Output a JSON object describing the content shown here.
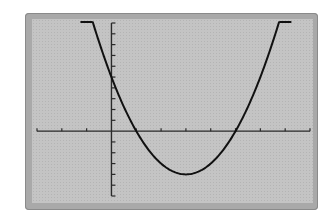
{
  "chart_data": {
    "type": "line",
    "title": "",
    "xlabel": "",
    "ylabel": "",
    "function": "y = x^2 - 6x + 5",
    "xlim": [
      -3,
      8
    ],
    "ylim": [
      -6,
      10
    ],
    "x_tick_step": 1,
    "y_tick_step": 1,
    "grid": false,
    "legend": null,
    "series": [
      {
        "name": "parabola",
        "x": [
          -1.2,
          -1,
          0,
          1,
          2,
          3,
          4,
          5,
          6,
          7,
          7.2
        ],
        "y": [
          13.64,
          12,
          5,
          0,
          -3,
          -4,
          -3,
          0,
          5,
          12,
          13.64
        ]
      }
    ],
    "key_points": {
      "x_intercepts": [
        1,
        5
      ],
      "y_intercept": 5,
      "vertex": [
        3,
        -4
      ]
    }
  },
  "colors": {
    "frame": "#a9a9a9",
    "screen": "#c4c4c4",
    "axis": "#2a2a2a",
    "curve": "#111111"
  }
}
